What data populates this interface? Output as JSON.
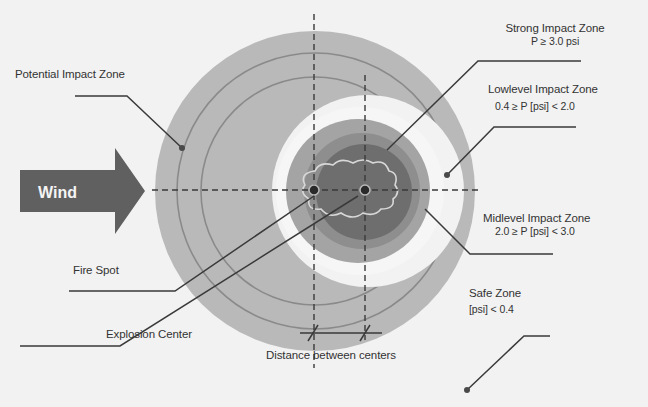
{
  "diagram": {
    "wind_label": "Wind",
    "labels": {
      "potential": "Potential Impact Zone",
      "strong_title": "Strong Impact Zone",
      "strong_range": "P ≥ 3.0 psi",
      "lowlevel_title": "Lowlevel Impact Zone",
      "lowlevel_range": "0.4 ≥ P [psi] < 2.0",
      "midlevel_title": "Midlevel Impact Zone",
      "midlevel_range": "2.0 ≥ P [psi] < 3.0",
      "safe_title": "Safe Zone",
      "safe_range": "[psi] < 0.4",
      "fire_spot": "Fire Spot",
      "explosion_center": "Explosion Center",
      "distance": "Distance between centers"
    },
    "colors": {
      "background": "#f2f2f2",
      "potential_zone": "#b9b9b9",
      "potential_ring": "#8a8a8a",
      "white_ring": "#f6f6f6",
      "lowlevel_zone": "#a4a4a4",
      "midlevel_zone": "#8e8e8e",
      "strong_zone": "#6e6e6e",
      "wind_arrow": "#606060",
      "leader_line": "#3a3a3a"
    }
  }
}
